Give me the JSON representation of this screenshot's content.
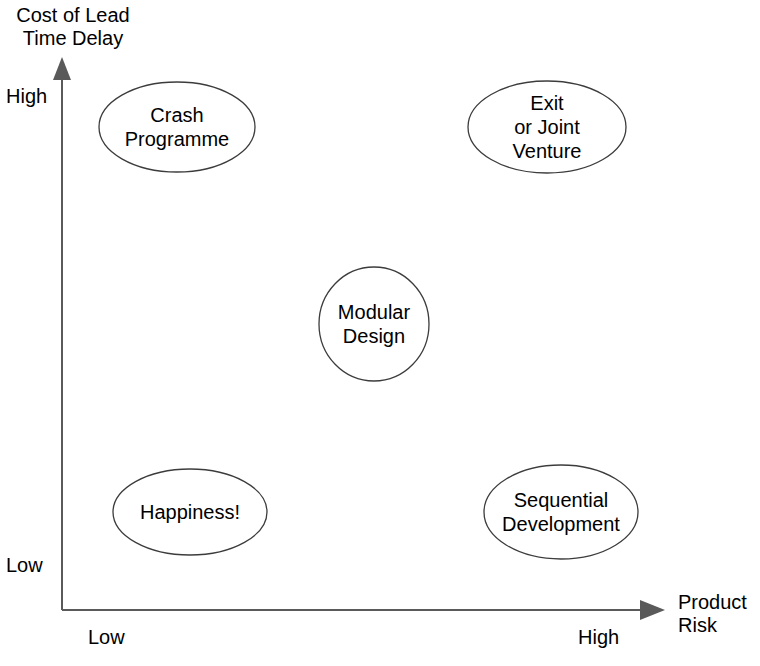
{
  "diagram": {
    "type": "2x2-matrix-bubble-diagram",
    "background_color": "#ffffff",
    "stroke_color": "#3c3c3c",
    "axis_color": "#5a5a5a",
    "text_color": "#000000",
    "y_axis": {
      "title": "Cost of Lead\nTime Delay",
      "high_label": "High",
      "low_label": "Low"
    },
    "x_axis": {
      "title": "Product\nRisk",
      "low_label": "Low",
      "high_label": "High"
    },
    "nodes": [
      {
        "id": "crash-programme",
        "label": "Crash\nProgramme",
        "shape": "ellipse",
        "cx": 177,
        "cy": 127,
        "rx": 78,
        "ry": 45,
        "quadrant": "low-risk-high-cost"
      },
      {
        "id": "exit-or-joint-venture",
        "label": "Exit\nor Joint\nVenture",
        "shape": "ellipse",
        "cx": 547,
        "cy": 127,
        "rx": 79,
        "ry": 46,
        "quadrant": "high-risk-high-cost"
      },
      {
        "id": "modular-design",
        "label": "Modular\nDesign",
        "shape": "circle",
        "cx": 374,
        "cy": 324,
        "rx": 55,
        "ry": 57,
        "quadrant": "centre"
      },
      {
        "id": "happiness",
        "label": "Happiness!",
        "shape": "ellipse",
        "cx": 190,
        "cy": 512,
        "rx": 77,
        "ry": 43,
        "quadrant": "low-risk-low-cost"
      },
      {
        "id": "sequential-development",
        "label": "Sequential\nDevelopment",
        "shape": "ellipse",
        "cx": 561,
        "cy": 512,
        "rx": 77,
        "ry": 47,
        "quadrant": "high-risk-low-cost"
      }
    ]
  }
}
